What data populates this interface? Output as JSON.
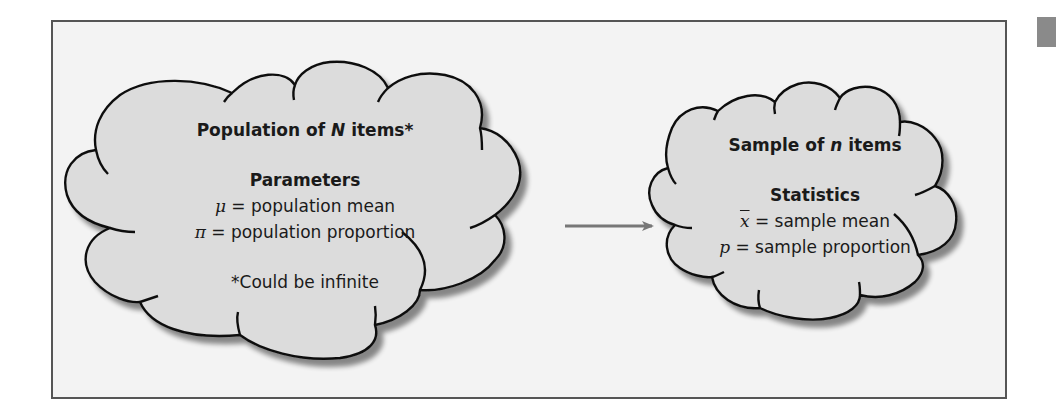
{
  "colors": {
    "frame_border": "#555555",
    "frame_background": "#f3f3f3",
    "cloud_fill": "#dcdcdc",
    "cloud_stroke": "#111111",
    "cloud_shadow": "#9a9a9a",
    "arrow": "#777777",
    "corner_tab": "#8a8a8a"
  },
  "population_cloud": {
    "title_prefix": "Population of ",
    "title_var": "N",
    "title_suffix": " items*",
    "section_heading": "Parameters",
    "items": [
      {
        "symbol": "μ",
        "text": " = population mean"
      },
      {
        "symbol": "π",
        "text": " = population proportion"
      }
    ],
    "footnote": "*Could be infinite"
  },
  "arrow": {
    "direction": "right",
    "from": "population",
    "to": "sample"
  },
  "sample_cloud": {
    "title_prefix": "Sample of ",
    "title_var": "n",
    "title_suffix": " items",
    "section_heading": "Statistics",
    "items": [
      {
        "symbol": "x",
        "overbar": true,
        "text": " = sample mean"
      },
      {
        "symbol": "p",
        "overbar": false,
        "text": " = sample proportion"
      }
    ]
  }
}
